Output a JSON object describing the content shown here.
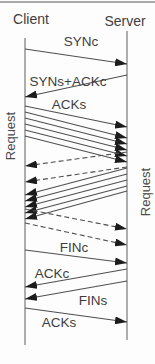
{
  "figure": {
    "background": "#fdfdfd",
    "top_rule_y": 2,
    "colors": {
      "top_rule": "#a9a9a9",
      "lifeline": "#8a8a8a",
      "message_line": "#4f4f4f",
      "arrowhead": "#1c1c1c",
      "text": "#3d3d3d"
    },
    "endpoints": [
      {
        "id": "client",
        "label": "Client",
        "x": 25,
        "line_top": 38,
        "line_bottom": 345,
        "label_x": 31,
        "label_y": 19
      },
      {
        "id": "server",
        "label": "Server",
        "x": 127,
        "line_top": 31,
        "line_bottom": 340,
        "label_x": 125,
        "label_y": 21
      }
    ],
    "messages": [
      {
        "name": "syn-c",
        "from": "client",
        "to": "server",
        "y_from": 49,
        "y_to": 64,
        "line": "solid"
      },
      {
        "name": "syn-s-ack-c",
        "from": "server",
        "to": "client",
        "y_from": 75,
        "y_to": 97,
        "line": "solid"
      },
      {
        "name": "ack-s",
        "from": "client",
        "to": "server",
        "y_from": 106,
        "y_to": 127,
        "line": "solid"
      },
      {
        "name": "request-seg-1",
        "from": "client",
        "to": "server",
        "y_from": 112,
        "y_to": 138,
        "line": "solid"
      },
      {
        "name": "request-seg-2",
        "from": "client",
        "to": "server",
        "y_from": 118,
        "y_to": 144,
        "line": "solid"
      },
      {
        "name": "request-seg-3",
        "from": "client",
        "to": "server",
        "y_from": 124,
        "y_to": 150,
        "line": "solid"
      },
      {
        "name": "request-seg-4",
        "from": "client",
        "to": "server",
        "y_from": 130,
        "y_to": 156,
        "line": "solid"
      },
      {
        "name": "request-seg-5",
        "from": "client",
        "to": "server",
        "y_from": 136,
        "y_to": 162,
        "line": "solid"
      },
      {
        "name": "server-ack-1",
        "from": "server",
        "to": "client",
        "y_from": 152,
        "y_to": 166,
        "line": "dashed"
      },
      {
        "name": "server-ack-2",
        "from": "server",
        "to": "client",
        "y_from": 167,
        "y_to": 182,
        "line": "dashed"
      },
      {
        "name": "response-seg-1",
        "from": "server",
        "to": "client",
        "y_from": 168,
        "y_to": 195,
        "line": "solid"
      },
      {
        "name": "response-seg-2",
        "from": "server",
        "to": "client",
        "y_from": 174,
        "y_to": 201,
        "line": "solid"
      },
      {
        "name": "response-seg-3",
        "from": "server",
        "to": "client",
        "y_from": 180,
        "y_to": 207,
        "line": "solid"
      },
      {
        "name": "response-seg-4",
        "from": "server",
        "to": "client",
        "y_from": 186,
        "y_to": 213,
        "line": "solid"
      },
      {
        "name": "response-seg-5",
        "from": "server",
        "to": "client",
        "y_from": 191,
        "y_to": 219,
        "line": "solid"
      },
      {
        "name": "client-ack-1",
        "from": "client",
        "to": "server",
        "y_from": 209,
        "y_to": 229,
        "line": "dashed"
      },
      {
        "name": "client-ack-2",
        "from": "client",
        "to": "server",
        "y_from": 223,
        "y_to": 245,
        "line": "dashed"
      },
      {
        "name": "fin-c",
        "from": "client",
        "to": "server",
        "y_from": 250,
        "y_to": 263,
        "line": "solid"
      },
      {
        "name": "ack-c",
        "from": "server",
        "to": "client",
        "y_from": 269,
        "y_to": 287,
        "line": "solid"
      },
      {
        "name": "fin-s",
        "from": "server",
        "to": "client",
        "y_from": 281,
        "y_to": 299,
        "line": "solid"
      },
      {
        "name": "ack-s-final",
        "from": "client",
        "to": "server",
        "y_from": 308,
        "y_to": 322,
        "line": "solid"
      }
    ],
    "labels": [
      {
        "text": "SYNc",
        "x": 81,
        "y": 41
      },
      {
        "text": "SYNs+ACKc",
        "x": 68,
        "y": 81
      },
      {
        "text": "ACKs",
        "x": 69,
        "y": 104
      },
      {
        "text": "FINc",
        "x": 74,
        "y": 247
      },
      {
        "text": "ACKc",
        "x": 52,
        "y": 273
      },
      {
        "text": "FINs",
        "x": 93,
        "y": 300
      },
      {
        "text": "ACKs",
        "x": 59,
        "y": 322
      }
    ],
    "rotated_labels": [
      {
        "text": "Request",
        "x": 10,
        "y": 136
      },
      {
        "text": "Request",
        "x": 145,
        "y": 192
      }
    ]
  }
}
